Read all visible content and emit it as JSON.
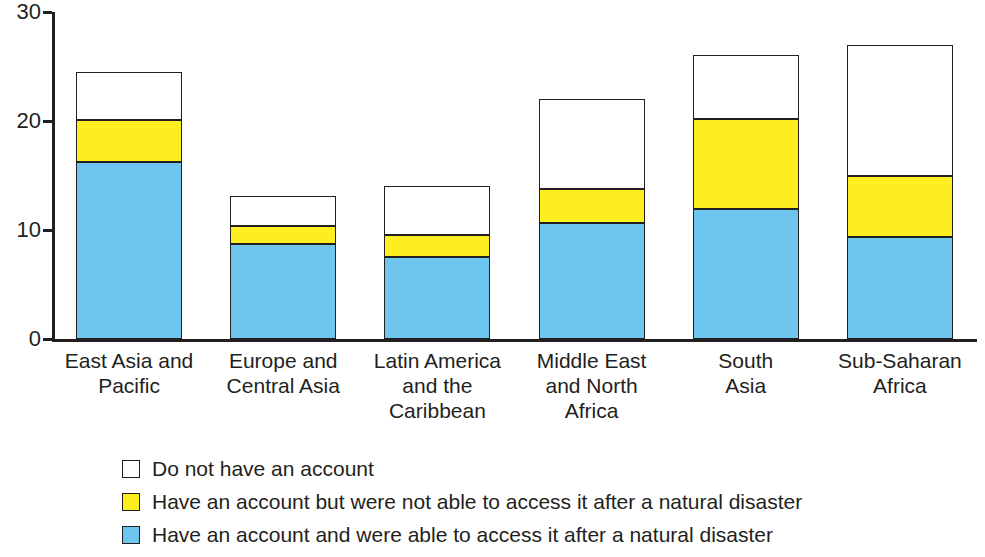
{
  "chart_data": {
    "type": "bar",
    "stacked": true,
    "title": "",
    "subtitle": "",
    "xlabel": "",
    "ylabel": "",
    "ylim": [
      0,
      30
    ],
    "yticks": [
      0,
      10,
      20,
      30
    ],
    "ytick_labels": [
      "0",
      "10",
      "20",
      "30"
    ],
    "grid": false,
    "legend_position": "bottom-left",
    "categories": [
      "East Asia and Pacific",
      "Europe and Central Asia",
      "Latin America and the Caribbean",
      "Middle East and North Africa",
      "South Asia",
      "Sub-Saharan Africa"
    ],
    "category_lines": [
      [
        "East Asia and",
        "Pacific"
      ],
      [
        "Europe and",
        "Central Asia"
      ],
      [
        "Latin America",
        "and the",
        "Caribbean"
      ],
      [
        "Middle East",
        "and North",
        "Africa"
      ],
      [
        "South",
        "Asia"
      ],
      [
        "Sub-Saharan",
        "Africa"
      ]
    ],
    "series": [
      {
        "name": "Have an account and were able to access it after a natural disaster",
        "color": "#6ec6ee",
        "values": [
          16.2,
          8.7,
          7.5,
          10.6,
          11.9,
          9.4
        ]
      },
      {
        "name": "Have an account but were not able to access it after a natural disaster",
        "color": "#fdee21",
        "values": [
          3.9,
          1.7,
          2.0,
          3.2,
          8.3,
          5.6
        ]
      },
      {
        "name": "Do not have an account",
        "color": "#ffffff",
        "values": [
          4.4,
          2.7,
          4.5,
          8.2,
          5.9,
          12.0
        ]
      }
    ],
    "totals": [
      24.5,
      13.1,
      14.0,
      22.0,
      26.1,
      27.0
    ]
  },
  "legend": {
    "entries": [
      {
        "label": "Do not have an account",
        "color": "#ffffff"
      },
      {
        "label": "Have an account but were not able to access it after a natural disaster",
        "color": "#fdee21"
      },
      {
        "label": "Have an account and were able to access it after a natural disaster",
        "color": "#6ec6ee"
      }
    ]
  },
  "axis": {
    "y_ticks": [
      "0",
      "10",
      "20",
      "30"
    ]
  }
}
